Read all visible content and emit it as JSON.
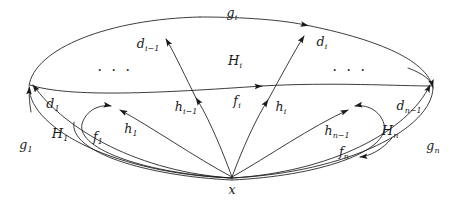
{
  "figure": {
    "background_color": "#ffffff",
    "stroke_color": "#1a1a1a",
    "width": 461,
    "height": 207
  },
  "basepoint": {
    "name": "x",
    "label": "x",
    "x": 232,
    "y": 190
  },
  "labels": [
    {
      "id": "g_i",
      "text": "g",
      "sub": "i",
      "x": 232,
      "y": 13
    },
    {
      "id": "d_i_m1",
      "text": "d",
      "sub": "i−1",
      "x": 148,
      "y": 44
    },
    {
      "id": "H_i",
      "text": "H",
      "sub": "i",
      "x": 235,
      "y": 60
    },
    {
      "id": "d_i",
      "text": "d",
      "sub": "i",
      "x": 322,
      "y": 42
    },
    {
      "id": "d_1",
      "text": "d",
      "sub": "1",
      "x": 53,
      "y": 104
    },
    {
      "id": "h_i_m1",
      "text": "h",
      "sub": "i−1",
      "x": 186,
      "y": 107
    },
    {
      "id": "f_i",
      "text": "f",
      "sub": "i",
      "x": 237,
      "y": 101
    },
    {
      "id": "h_i",
      "text": "h",
      "sub": "i",
      "x": 281,
      "y": 107
    },
    {
      "id": "d_n_m1",
      "text": "d",
      "sub": "n−1",
      "x": 409,
      "y": 106
    },
    {
      "id": "H_1",
      "text": "H",
      "sub": "1",
      "x": 60,
      "y": 133
    },
    {
      "id": "f_1",
      "text": "f",
      "sub": "1",
      "x": 98,
      "y": 137
    },
    {
      "id": "h_1",
      "text": "h",
      "sub": "1",
      "x": 131,
      "y": 129
    },
    {
      "id": "h_n_m1",
      "text": "h",
      "sub": "n−1",
      "x": 337,
      "y": 131
    },
    {
      "id": "H_n",
      "text": "H",
      "sub": "n",
      "x": 390,
      "y": 130
    },
    {
      "id": "g_1",
      "text": "g",
      "sub": "1",
      "x": 26,
      "y": 145
    },
    {
      "id": "f_n",
      "text": "f",
      "sub": "n",
      "x": 344,
      "y": 152
    },
    {
      "id": "g_n",
      "text": "g",
      "sub": "n",
      "x": 433,
      "y": 146
    }
  ],
  "ellipses": [
    {
      "id": "ellipsis-left",
      "text": "· · ·",
      "x": 115,
      "y": 70
    },
    {
      "id": "ellipsis-right",
      "text": "· · ·",
      "x": 350,
      "y": 70
    }
  ],
  "curves": {
    "outer_boundary": "outer ellipse through left vertex, top, right vertex and basepoint x",
    "middle_arc": "inner ellipse arc from left vertex through center to right vertex",
    "inner_loops": "small loops f1 (left) and fn (right) anchored at x",
    "rays": "five rays emanating from basepoint x: h1, h_i-1, d_i-1, d_i, h_i, h_n-1"
  }
}
